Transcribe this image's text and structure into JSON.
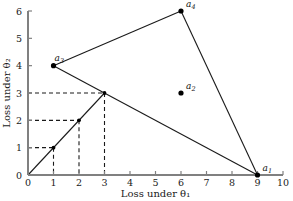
{
  "chart_data": {
    "type": "scatter",
    "title": "",
    "xlabel": "Loss under θ₁",
    "ylabel": "Loss under θ₂",
    "xlim": [
      0,
      10
    ],
    "ylim": [
      0,
      6
    ],
    "xticks": [
      "0",
      "1",
      "2",
      "3",
      "4",
      "5",
      "6",
      "7",
      "8",
      "9",
      "10"
    ],
    "yticks": [
      "0",
      "1",
      "2",
      "3",
      "4",
      "5",
      "6"
    ],
    "grid": false,
    "legend": "none",
    "points": [
      {
        "name": "a1",
        "label": "a",
        "sub": "1",
        "x": 9,
        "y": 0,
        "label_dx": 5,
        "label_dy": -4
      },
      {
        "name": "a2",
        "label": "a",
        "sub": "2",
        "x": 6,
        "y": 3,
        "label_dx": 5,
        "label_dy": -4
      },
      {
        "name": "a3",
        "label": "a",
        "sub": "3",
        "x": 1,
        "y": 4,
        "label_dx": 1,
        "label_dy": -5
      },
      {
        "name": "a4",
        "label": "a",
        "sub": "4",
        "x": 6,
        "y": 6,
        "label_dx": 5,
        "label_dy": -4
      }
    ],
    "hull_edges": [
      {
        "from": [
          1,
          4
        ],
        "to": [
          6,
          6
        ]
      },
      {
        "from": [
          6,
          6
        ],
        "to": [
          9,
          0
        ]
      },
      {
        "from": [
          1,
          4
        ],
        "to": [
          9,
          0
        ]
      }
    ],
    "randomized_rule_line": {
      "from": [
        0,
        0
      ],
      "to": [
        3,
        3
      ]
    },
    "marked_points": [
      {
        "x": 1,
        "y": 1
      },
      {
        "x": 2,
        "y": 2
      },
      {
        "x": 3,
        "y": 3
      }
    ],
    "dashed_guides": [
      {
        "y": 1,
        "x": 1
      },
      {
        "y": 2,
        "x": 2
      },
      {
        "y": 3,
        "x": 3
      }
    ],
    "colors": {
      "axis": "#808080",
      "line": "#1a1a1a",
      "point": "#000000",
      "dashed": "#1a1a1a",
      "background": "#ffffff"
    }
  }
}
